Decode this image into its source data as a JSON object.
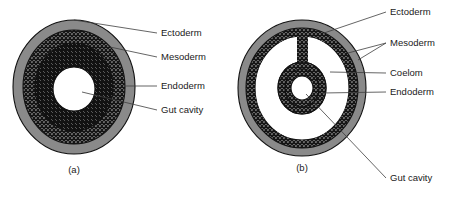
{
  "figure": {
    "background_color": "#ffffff",
    "text_color": "#1a1a1a",
    "leader_color": "#3d3d3d",
    "outline_color": "#111111"
  },
  "diagrams": [
    {
      "id": "a",
      "caption": "(a)",
      "description": "Acoelomate cross-section: solid mesoderm between ectoderm and endoderm, with central gut cavity",
      "layers": [
        {
          "name": "Ectoderm",
          "fill_style": "solid-gray",
          "color": "#8a8a8a"
        },
        {
          "name": "Mesoderm",
          "fill_style": "crosshatch-diamond",
          "color": "#2b2b2b"
        },
        {
          "name": "Endoderm",
          "fill_style": "diagonal-hatch",
          "color": "#1f1f1f"
        },
        {
          "name": "Gut cavity",
          "fill_style": "white",
          "color": "#ffffff"
        }
      ],
      "labels": [
        {
          "text": "Ectoderm",
          "target": "outer-gray-ring"
        },
        {
          "text": "Mesoderm",
          "target": "crosshatch-ring"
        },
        {
          "text": "Endoderm",
          "target": "hatched-ring"
        },
        {
          "text": "Gut cavity",
          "target": "central-white-space"
        }
      ]
    },
    {
      "id": "b",
      "caption": "(b)",
      "description": "Coelomate cross-section: body cavity (coelom) splits the mesoderm into outer and inner layers joined by a mesentery",
      "layers": [
        {
          "name": "Ectoderm",
          "fill_style": "solid-gray",
          "color": "#8a8a8a"
        },
        {
          "name": "Mesoderm",
          "fill_style": "crosshatch-diamond",
          "color": "#2b2b2b"
        },
        {
          "name": "Coelom",
          "fill_style": "white",
          "color": "#ffffff"
        },
        {
          "name": "Endoderm",
          "fill_style": "crosshatch-diamond",
          "color": "#2b2b2b"
        },
        {
          "name": "Gut cavity",
          "fill_style": "white",
          "color": "#ffffff"
        }
      ],
      "labels": [
        {
          "text": "Ectoderm",
          "target": "outer-gray-ring"
        },
        {
          "text": "Mesoderm",
          "target": "outer-and-inner-mesoderm",
          "leader_count": 2
        },
        {
          "text": "Coelom",
          "target": "white-c-shaped-cavity"
        },
        {
          "text": "Endoderm",
          "target": "inner-crosshatch-ring"
        },
        {
          "text": "Gut cavity",
          "target": "central-white-space"
        }
      ]
    }
  ],
  "labels_a": {
    "ectoderm": "Ectoderm",
    "mesoderm": "Mesoderm",
    "endoderm": "Endoderm",
    "gut_cavity": "Gut cavity",
    "caption": "(a)"
  },
  "labels_b": {
    "ectoderm": "Ectoderm",
    "mesoderm": "Mesoderm",
    "coelom": "Coelom",
    "endoderm": "Endoderm",
    "gut_cavity": "Gut cavity",
    "caption": "(b)"
  }
}
